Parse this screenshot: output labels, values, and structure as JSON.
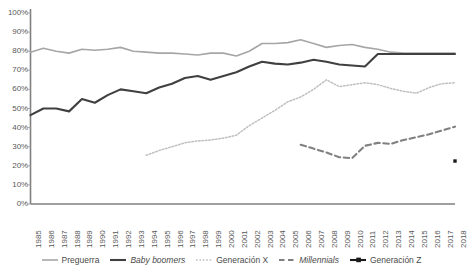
{
  "chart_data": {
    "type": "line",
    "title": "",
    "subtitle": "",
    "xlabel": "",
    "ylabel": "",
    "ylim": [
      0,
      100
    ],
    "yticks": [
      "0%",
      "10%",
      "20%",
      "30%",
      "40%",
      "50%",
      "60%",
      "70%",
      "80%",
      "90%",
      "100%"
    ],
    "ytick_values": [
      0,
      10,
      20,
      30,
      40,
      50,
      60,
      70,
      80,
      90,
      100
    ],
    "grid": false,
    "legend_position": "bottom",
    "categories": [
      "1985",
      "1986",
      "1987",
      "1988",
      "1989",
      "1990",
      "1991",
      "1992",
      "1993",
      "1994",
      "1995",
      "1996",
      "1997",
      "1998",
      "1999",
      "2000",
      "2001",
      "2002",
      "2003",
      "2004",
      "2005",
      "2006",
      "2007",
      "2008",
      "2009",
      "2010",
      "2011",
      "2012",
      "2013",
      "2014",
      "2015",
      "2016",
      "2017",
      "2018"
    ],
    "series": [
      {
        "name": "Preguerra",
        "style": "solid-light",
        "color": "#a6a6a6",
        "values": [
          79.5,
          81.5,
          80.0,
          79.0,
          81.0,
          80.5,
          81.0,
          82.0,
          80.0,
          79.5,
          79.0,
          79.0,
          78.5,
          78.0,
          79.0,
          79.0,
          77.5,
          80.0,
          84.0,
          84.0,
          84.5,
          86.0,
          84.0,
          82.0,
          83.0,
          83.5,
          82.0,
          81.0,
          79.5,
          79.0,
          79.0,
          79.0,
          79.0,
          79.0
        ]
      },
      {
        "name": "Baby boomers",
        "style": "solid-dark",
        "color": "#404040",
        "values": [
          46.5,
          50.0,
          50.0,
          48.5,
          55.0,
          53.0,
          57.0,
          60.0,
          59.0,
          58.0,
          61.0,
          63.0,
          66.0,
          67.0,
          65.0,
          67.0,
          69.0,
          72.0,
          74.5,
          73.5,
          73.0,
          74.0,
          75.5,
          74.5,
          73.0,
          72.5,
          72.0,
          78.5,
          78.5,
          78.5,
          78.5,
          78.5,
          78.5,
          78.5
        ]
      },
      {
        "name": "Generación X",
        "style": "dotted",
        "color": "#bfbfbf",
        "start_year": "1994",
        "values": [
          null,
          null,
          null,
          null,
          null,
          null,
          null,
          null,
          null,
          25.5,
          28.0,
          30.0,
          32.0,
          33.0,
          33.5,
          34.5,
          36.0,
          41.0,
          45.0,
          49.0,
          53.5,
          56.0,
          60.0,
          65.0,
          61.5,
          62.5,
          63.5,
          62.5,
          60.5,
          59.0,
          58.0,
          61.0,
          63.0,
          63.5
        ]
      },
      {
        "name": "Millennials",
        "style": "dashed",
        "color": "#808080",
        "start_year": "2006",
        "values": [
          null,
          null,
          null,
          null,
          null,
          null,
          null,
          null,
          null,
          null,
          null,
          null,
          null,
          null,
          null,
          null,
          null,
          null,
          null,
          null,
          null,
          31.0,
          29.0,
          27.0,
          24.5,
          24.0,
          30.5,
          32.0,
          31.5,
          33.5,
          35.0,
          36.5,
          38.5,
          40.5
        ]
      },
      {
        "name": "Generación Z",
        "style": "marker-only",
        "color": "#1a1a1a",
        "values": [
          null,
          null,
          null,
          null,
          null,
          null,
          null,
          null,
          null,
          null,
          null,
          null,
          null,
          null,
          null,
          null,
          null,
          null,
          null,
          null,
          null,
          null,
          null,
          null,
          null,
          null,
          null,
          null,
          null,
          null,
          null,
          null,
          null,
          22.5
        ]
      }
    ],
    "legend": [
      {
        "label": "Preguerra",
        "style": "solid-light",
        "italic": false
      },
      {
        "label": "Baby boomers",
        "style": "solid-dark",
        "italic": true
      },
      {
        "label": "Generación X",
        "style": "dotted",
        "italic": false
      },
      {
        "label": "Millennials",
        "style": "dashed",
        "italic": true
      },
      {
        "label": "Generación Z",
        "style": "marker-only",
        "italic": false
      }
    ]
  }
}
